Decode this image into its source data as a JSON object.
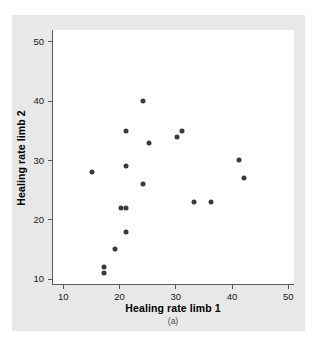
{
  "chart_data": {
    "type": "scatter",
    "title": "",
    "xlabel": "Healing rate limb 1",
    "ylabel": "Healing rate limb 2",
    "caption": "(a)",
    "xlim": [
      8,
      51
    ],
    "ylim": [
      9,
      52
    ],
    "xticks": [
      10,
      20,
      30,
      40,
      50
    ],
    "yticks": [
      10,
      20,
      30,
      40,
      50
    ],
    "xtick_labels": [
      "10",
      "20",
      "30",
      "40",
      "50"
    ],
    "ytick_labels": [
      "10",
      "20",
      "30",
      "40",
      "50"
    ],
    "grid": false,
    "legend": null,
    "marker": {
      "shape": "circle",
      "color": "#3a3a3a",
      "size_px": 5
    },
    "colors": {
      "figure_background": "#e8e8e8",
      "plot_background": "#ffffff",
      "axis_line": "#5a5a5a",
      "text": "#000000",
      "point": "#3a3a3a"
    },
    "n_points": 18,
    "points": [
      {
        "x": 15,
        "y": 28
      },
      {
        "x": 17,
        "y": 12
      },
      {
        "x": 17,
        "y": 11
      },
      {
        "x": 19,
        "y": 15
      },
      {
        "x": 20,
        "y": 22
      },
      {
        "x": 21,
        "y": 22
      },
      {
        "x": 21,
        "y": 18
      },
      {
        "x": 21,
        "y": 29
      },
      {
        "x": 21,
        "y": 35
      },
      {
        "x": 24,
        "y": 40
      },
      {
        "x": 24,
        "y": 26
      },
      {
        "x": 25,
        "y": 33
      },
      {
        "x": 30,
        "y": 34
      },
      {
        "x": 31,
        "y": 35
      },
      {
        "x": 33,
        "y": 23
      },
      {
        "x": 36,
        "y": 23
      },
      {
        "x": 41,
        "y": 30
      },
      {
        "x": 42,
        "y": 27
      }
    ]
  }
}
